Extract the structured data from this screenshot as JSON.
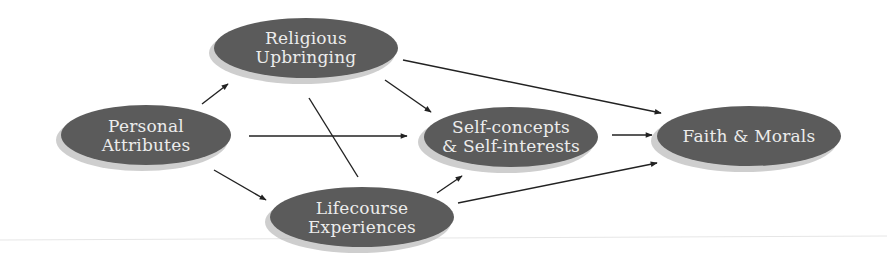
{
  "diagram": {
    "type": "path-diagram",
    "colors": {
      "node_fill": "#5b5b5b",
      "node_shadow": "#bdbdbd",
      "node_text": "#ececec",
      "edge": "#222222",
      "background": "#ffffff"
    },
    "nodes": [
      {
        "id": "personal",
        "lines": [
          "Personal",
          "Attributes"
        ]
      },
      {
        "id": "religious",
        "lines": [
          "Religious",
          "Upbringing"
        ]
      },
      {
        "id": "lifecourse",
        "lines": [
          "Lifecourse",
          "Experiences"
        ]
      },
      {
        "id": "self",
        "lines": [
          "Self-concepts",
          "& Self-interests"
        ]
      },
      {
        "id": "faith",
        "lines": [
          "Faith & Morals"
        ]
      }
    ],
    "edges": [
      {
        "from": "Personal Attributes",
        "to": "Religious Upbringing",
        "arrow": true
      },
      {
        "from": "Personal Attributes",
        "to": "Self-concepts & Self-interests",
        "arrow": true
      },
      {
        "from": "Personal Attributes",
        "to": "Lifecourse Experiences",
        "arrow": true
      },
      {
        "from": "Religious Upbringing",
        "to": "Self-concepts & Self-interests",
        "arrow": true
      },
      {
        "from": "Religious Upbringing",
        "to": "Faith & Morals",
        "arrow": true
      },
      {
        "from": "Religious Upbringing",
        "to": "Lifecourse Experiences",
        "arrow": false
      },
      {
        "from": "Lifecourse Experiences",
        "to": "Self-concepts & Self-interests",
        "arrow": true
      },
      {
        "from": "Lifecourse Experiences",
        "to": "Faith & Morals",
        "arrow": true
      },
      {
        "from": "Self-concepts & Self-interests",
        "to": "Faith & Morals",
        "arrow": true
      }
    ]
  }
}
